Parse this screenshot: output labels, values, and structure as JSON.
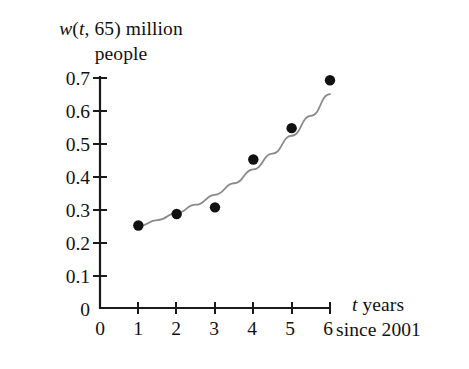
{
  "figure": {
    "background_color": "#ffffff",
    "axis_color": "#1a1a1a",
    "curve_color": "#8a8a8a",
    "point_color": "#111111"
  },
  "axes": {
    "y_title_line1": "w(t, 65) million",
    "y_title_line2": "people",
    "y_title_italic_tokens": [
      "w",
      "t"
    ],
    "x_title_line1": "t years",
    "x_title_line2": "since 2001",
    "x_title_italic_tokens": [
      "t"
    ],
    "y_tick_labels": [
      "0.7",
      "0.6",
      "0.5",
      "0.4",
      "0.3",
      "0.2",
      "0.1",
      "0"
    ],
    "x_tick_labels": [
      "0",
      "1",
      "2",
      "3",
      "4",
      "5",
      "6"
    ]
  },
  "chart_data": {
    "type": "scatter",
    "title": "",
    "subtitle": "",
    "xlabel": "t years since 2001",
    "ylabel": "w(t, 65) million people",
    "xlim": [
      0,
      6
    ],
    "ylim": [
      0,
      0.7
    ],
    "xticks": [
      0,
      1,
      2,
      3,
      4,
      5,
      6
    ],
    "yticks": [
      0,
      0.1,
      0.2,
      0.3,
      0.4,
      0.5,
      0.6,
      0.7
    ],
    "grid": false,
    "legend": "none",
    "x": [
      1,
      2,
      3,
      4,
      5,
      6
    ],
    "series": [
      {
        "name": "w(t, 65) data points",
        "marker": "filled-circle",
        "values": [
          0.25,
          0.285,
          0.305,
          0.45,
          0.545,
          0.69
        ]
      },
      {
        "name": "fitted exponential curve",
        "marker": "none",
        "style": "solid-gray-line",
        "x": [
          1,
          1.5,
          2,
          2.5,
          3,
          3.5,
          4,
          4.5,
          5,
          5.5,
          6
        ],
        "values": [
          0.247,
          0.266,
          0.288,
          0.313,
          0.343,
          0.378,
          0.42,
          0.468,
          0.522,
          0.582,
          0.648
        ]
      }
    ],
    "annotations": []
  }
}
